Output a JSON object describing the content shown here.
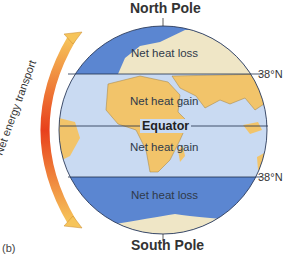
{
  "diagram": {
    "labels": {
      "north_pole": "North Pole",
      "south_pole": "South Pole",
      "equator": "Equator",
      "lat_north": "38°N",
      "lat_south": "38°N",
      "arrow_caption": "Net energy transport",
      "panel": "(b)"
    },
    "zones": [
      {
        "id": "north-polar",
        "label": "Net heat loss"
      },
      {
        "id": "north-tropical",
        "label": "Net heat gain"
      },
      {
        "id": "south-tropical",
        "label": "Net heat gain"
      },
      {
        "id": "south-polar",
        "label": "Net heat loss"
      }
    ],
    "colors": {
      "polar_ocean": "#5b86d1",
      "tropical_ocean": "#c9daf2",
      "land": "#f2c46a",
      "ice": "#efe6c6",
      "arrow_hot": "#e8401c",
      "arrow_cool": "#f6c45a"
    }
  }
}
